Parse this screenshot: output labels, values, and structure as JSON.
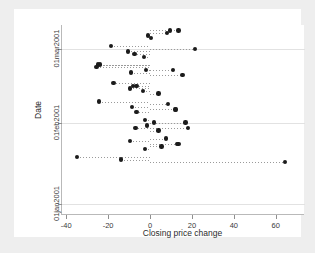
{
  "chart_data": {
    "type": "scatter",
    "title": "",
    "xlabel": "Closing price change",
    "ylabel": "Date",
    "xlim": [
      -42,
      74
    ],
    "ylim_dates": [
      "28dec2000",
      "10mar2001"
    ],
    "grid": true,
    "legend": "none",
    "marker": "filled-circle",
    "marker_color": "#1b1b1b",
    "dropline_style": "dotted-to-zero",
    "xticks": [
      -40,
      -20,
      0,
      20,
      40,
      60
    ],
    "xticklabels": [
      "-40",
      "-20",
      "0",
      "20",
      "40",
      "60"
    ],
    "yticks": [
      "01jan2001",
      "01feb2001",
      "01mar2001"
    ],
    "yticklabels": [
      "01jan2001",
      "01feb2001",
      "01mar2001"
    ],
    "y_axis_direction": "increasing-upward",
    "points": [
      {
        "date": "08mar2001",
        "x": 9.5
      },
      {
        "date": "08mar2001",
        "x": 13.5
      },
      {
        "date": "07mar2001",
        "x": 8.0
      },
      {
        "date": "06mar2001",
        "x": -1.0
      },
      {
        "date": "05mar2001",
        "x": 0.5
      },
      {
        "date": "02mar2001",
        "x": -18.5
      },
      {
        "date": "01mar2001",
        "x": 21.5
      },
      {
        "date": "28feb2001",
        "x": -10.5
      },
      {
        "date": "27feb2001",
        "x": -7.5
      },
      {
        "date": "26feb2001",
        "x": -3.0
      },
      {
        "date": "23feb2001",
        "x": -24.0
      },
      {
        "date": "23feb2001",
        "x": -24.8
      },
      {
        "date": "22feb2001",
        "x": -25.5
      },
      {
        "date": "21feb2001",
        "x": 11.0
      },
      {
        "date": "21feb2001",
        "x": -2.0
      },
      {
        "date": "20feb2001",
        "x": -9.0
      },
      {
        "date": "19feb2001",
        "x": 15.5
      },
      {
        "date": "16feb2001",
        "x": -17.5
      },
      {
        "date": "15feb2001",
        "x": -8.0
      },
      {
        "date": "15feb2001",
        "x": -6.5
      },
      {
        "date": "14feb2001",
        "x": -9.5
      },
      {
        "date": "13feb2001",
        "x": -3.5
      },
      {
        "date": "12feb2001",
        "x": 4.0
      },
      {
        "date": "09feb2001",
        "x": -24.5
      },
      {
        "date": "08feb2001",
        "x": 8.5
      },
      {
        "date": "07feb2001",
        "x": -8.5
      },
      {
        "date": "06feb2001",
        "x": 12.0
      },
      {
        "date": "06feb2001",
        "x": 12.5
      },
      {
        "date": "05feb2001",
        "x": -6.5
      },
      {
        "date": "02feb2001",
        "x": -2.5
      },
      {
        "date": "01feb2001",
        "x": 2.0
      },
      {
        "date": "01feb2001",
        "x": 17.0
      },
      {
        "date": "31jan2001",
        "x": -1.5
      },
      {
        "date": "30jan2001",
        "x": -7.0
      },
      {
        "date": "30jan2001",
        "x": 18.0
      },
      {
        "date": "29jan2001",
        "x": 4.0
      },
      {
        "date": "26jan2001",
        "x": 7.5
      },
      {
        "date": "25jan2001",
        "x": -9.5
      },
      {
        "date": "24jan2001",
        "x": 13.0
      },
      {
        "date": "24jan2001",
        "x": 13.5
      },
      {
        "date": "23jan2001",
        "x": 5.5
      },
      {
        "date": "22jan2001",
        "x": -2.5
      },
      {
        "date": "19jan2001",
        "x": -35.0
      },
      {
        "date": "18jan2001",
        "x": -14.0
      },
      {
        "date": "17jan2001",
        "x": 64.5
      }
    ]
  },
  "axes": {
    "x_title": "Closing price change",
    "y_title": "Date"
  }
}
